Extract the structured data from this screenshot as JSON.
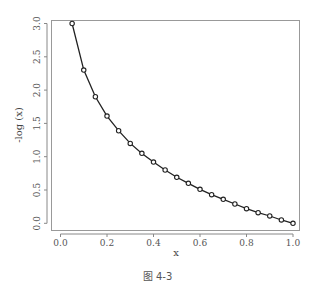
{
  "caption": "图 4-3",
  "chart_data": {
    "type": "line",
    "title": "",
    "xlabel": "x",
    "ylabel": "-log (x)",
    "x": [
      0.05,
      0.1,
      0.15,
      0.2,
      0.25,
      0.3,
      0.35,
      0.4,
      0.45,
      0.5,
      0.55,
      0.6,
      0.65,
      0.7,
      0.75,
      0.8,
      0.85,
      0.9,
      0.95,
      1.0
    ],
    "series": [
      {
        "name": "-log(x)",
        "values": [
          3.0,
          2.3,
          1.9,
          1.61,
          1.39,
          1.2,
          1.05,
          0.92,
          0.8,
          0.69,
          0.6,
          0.51,
          0.43,
          0.36,
          0.29,
          0.22,
          0.16,
          0.11,
          0.05,
          0.0
        ],
        "marker": "open-circle",
        "line": "solid"
      }
    ],
    "xlim": [
      0.0,
      1.0
    ],
    "ylim": [
      0.0,
      3.0
    ],
    "xticks": [
      "0.0",
      "0.2",
      "0.4",
      "0.6",
      "0.8",
      "1.0"
    ],
    "yticks": [
      "0.0",
      "0.5",
      "1.0",
      "1.5",
      "2.0",
      "2.5",
      "3.0"
    ],
    "grid": false,
    "legend": null,
    "colors": {
      "line": "#222222",
      "axis": "#888888",
      "box": "#999999"
    }
  }
}
